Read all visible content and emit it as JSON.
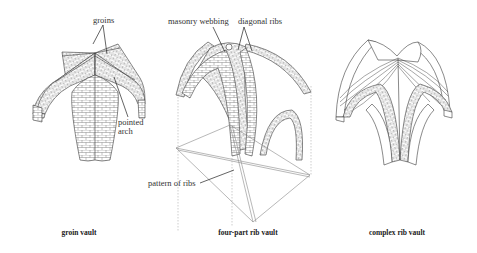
{
  "figure": {
    "panels": [
      {
        "id": "groin",
        "caption": "groin vault",
        "callouts": [
          {
            "text": "groins"
          },
          {
            "text": "pointed"
          },
          {
            "text": "arch"
          }
        ]
      },
      {
        "id": "four-part",
        "caption": "four-part rib vault",
        "callouts": [
          {
            "text": "masonry webbing"
          },
          {
            "text": "diagonal ribs"
          },
          {
            "text": "pattern of ribs"
          }
        ]
      },
      {
        "id": "complex",
        "caption": "complex rib vault",
        "callouts": []
      }
    ]
  },
  "colors": {
    "line": "#3a3a3a",
    "light_line": "#8a8a8a",
    "background": "#ffffff"
  }
}
